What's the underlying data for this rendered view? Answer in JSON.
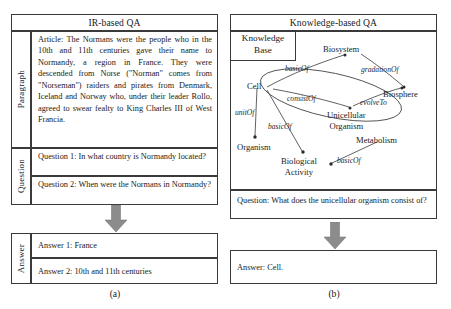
{
  "figure": {
    "panels": [
      {
        "id": "a",
        "caption": "(a)",
        "title": "IR-based QA",
        "rows": [
          {
            "label": "Paragraph",
            "cells": [
              "Article: The Normans were the people who in the 10th and 11th centuries gave their name to Normandy, a region in France. They were descended from Norse (\"Norman\" comes from \"Norseman\") raiders and pirates from Denmark, Iceland and Norway who, under their leader Rollo, agreed to swear fealty to King Charles III of West Francia."
            ]
          },
          {
            "label": "Question",
            "cells": [
              "Question 1: In what country is Normandy located?",
              "Question 2:  When were the Normans in Normandy?"
            ]
          }
        ],
        "answer": {
          "label": "Answer",
          "cells": [
            "Answer 1: France",
            "Answer 2: 10th and 11th centuries"
          ]
        }
      },
      {
        "id": "b",
        "caption": "(b)",
        "title": "Knowledge-based QA",
        "knowledge_base_label": "Knowledge\nBase",
        "knowledge_base_line1": "Knowledge",
        "knowledge_base_line2": "Base",
        "question": "Question: What does the unicellular organism consist of?",
        "answer": "Answer: Cell."
      }
    ]
  },
  "graph": {
    "nodes": [
      {
        "id": "cell",
        "label": "Cell"
      },
      {
        "id": "biosystem",
        "label": "Biosystem"
      },
      {
        "id": "biosphere",
        "label": "Biosphere"
      },
      {
        "id": "unicellular",
        "label": "Unicellular",
        "label2": "Organism"
      },
      {
        "id": "organism",
        "label": "Organism"
      },
      {
        "id": "biological",
        "label": "Biological",
        "label2": "Activity"
      },
      {
        "id": "metabolism",
        "label": "Metabolism"
      }
    ],
    "edges": [
      {
        "from": "cell",
        "to": "biosystem",
        "label": "basicOf"
      },
      {
        "from": "biosystem",
        "to": "biosphere",
        "label": "gradationOf"
      },
      {
        "from": "cell",
        "to": "unicellular",
        "label": "consistOf"
      },
      {
        "from": "unicellular",
        "to": "biosphere",
        "label": "evolveTo"
      },
      {
        "from": "cell",
        "to": "organism",
        "label": "unitOf"
      },
      {
        "from": "cell",
        "to": "biological",
        "label": "basicOf"
      },
      {
        "from": "metabolism",
        "to": "biological",
        "label": "basicOf"
      }
    ],
    "highlight_shape": "ellipse-around-cell-and-unicellular-organism"
  },
  "colors": {
    "border": "#3a3a3a",
    "arrow_fill": "#8c8c8c",
    "arrow_stroke": "#6e6e6e",
    "text": "#1a1a1a",
    "background": "#ffffff"
  }
}
